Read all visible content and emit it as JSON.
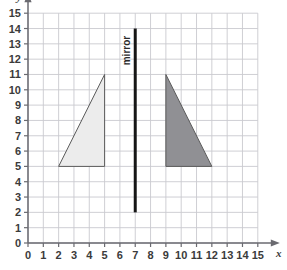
{
  "figure": {
    "type": "coordinate-grid-diagram"
  },
  "axes": {
    "x_name": "x",
    "y_name": "y",
    "x_ticks": [
      "0",
      "1",
      "2",
      "3",
      "4",
      "5",
      "6",
      "7",
      "8",
      "9",
      "10",
      "11",
      "12",
      "13",
      "14",
      "15"
    ],
    "y_ticks": [
      "0",
      "1",
      "2",
      "3",
      "4",
      "5",
      "6",
      "7",
      "8",
      "9",
      "10",
      "11",
      "12",
      "13",
      "14",
      "15"
    ],
    "x_min": 0,
    "x_max": 15,
    "y_min": 0,
    "y_max": 15,
    "grid": true,
    "grid_color": "#c9c9cf",
    "axis_color": "#6a6a70",
    "label_color": "#3b3b3b"
  },
  "mirror": {
    "label": "mirror",
    "x": 7,
    "y_start": 2,
    "y_end": 14,
    "color": "#161616",
    "width_px": 3
  },
  "shapes": [
    {
      "name": "object-triangle",
      "points": [
        [
          2,
          5
        ],
        [
          5,
          5
        ],
        [
          5,
          11
        ]
      ],
      "fill": "#ececec",
      "stroke": "#5a5a5a"
    },
    {
      "name": "image-triangle",
      "points": [
        [
          9,
          5
        ],
        [
          9,
          11
        ],
        [
          12,
          5
        ]
      ],
      "fill": "#909094",
      "stroke": "#5a5a5a"
    }
  ],
  "chart_data": {
    "type": "scatter",
    "title": "",
    "xlabel": "x",
    "ylabel": "y",
    "xlim": [
      0,
      15
    ],
    "ylim": [
      0,
      15
    ],
    "grid": true,
    "annotations": [
      {
        "text": "mirror",
        "x": 7,
        "orientation": "vertical"
      }
    ],
    "series": [
      {
        "name": "object-triangle",
        "type": "polygon",
        "x": [
          2,
          5,
          5
        ],
        "y": [
          5,
          5,
          11
        ],
        "fill": "#ececec"
      },
      {
        "name": "image-triangle",
        "type": "polygon",
        "x": [
          9,
          9,
          12
        ],
        "y": [
          5,
          11,
          5
        ],
        "fill": "#909094"
      },
      {
        "name": "mirror-line",
        "type": "line",
        "x": [
          7,
          7
        ],
        "y": [
          2,
          14
        ],
        "color": "#161616"
      }
    ]
  }
}
